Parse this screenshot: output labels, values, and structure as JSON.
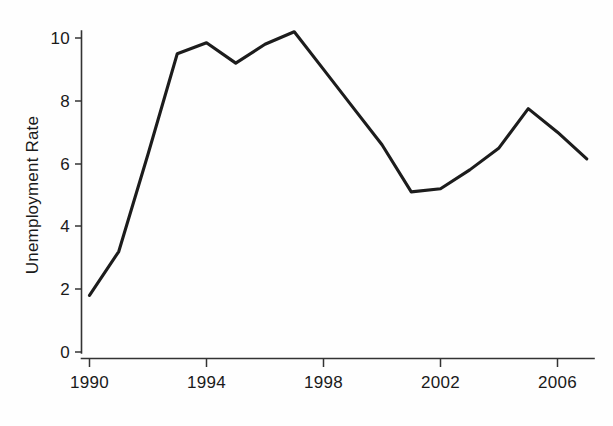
{
  "chart_data": {
    "type": "line",
    "title": "",
    "xlabel": "",
    "ylabel": "Unemployment Rate",
    "x": [
      1990,
      1991,
      1992,
      1993,
      1994,
      1995,
      1996,
      1997,
      1998,
      1999,
      2000,
      2001,
      2002,
      2003,
      2004,
      2005,
      2006,
      2007
    ],
    "values": [
      1.8,
      3.2,
      6.3,
      9.5,
      9.85,
      9.2,
      9.8,
      10.2,
      9.0,
      7.8,
      6.6,
      5.1,
      5.2,
      5.8,
      6.5,
      7.75,
      7.0,
      6.15
    ],
    "series": [
      {
        "name": "Unemployment Rate",
        "values": [
          1.8,
          3.2,
          6.3,
          9.5,
          9.85,
          9.2,
          9.8,
          10.2,
          9.0,
          7.8,
          6.6,
          5.1,
          5.2,
          5.8,
          6.5,
          7.75,
          7.0,
          6.15
        ],
        "color": "#1c1c1c"
      }
    ],
    "xlim": [
      1990,
      2007.6
    ],
    "ylim": [
      0,
      10.8
    ],
    "xticks": [
      1990,
      1994,
      1998,
      2002,
      2006
    ],
    "xtick_labels": [
      "1990",
      "1994",
      "1998",
      "2002",
      "2006"
    ],
    "yticks": [
      0,
      2,
      4,
      6,
      8,
      10
    ],
    "ytick_labels": [
      "0",
      "2",
      "4",
      "6",
      "8",
      "10"
    ],
    "grid": false,
    "legend": false,
    "legend_position": "none",
    "annotations": []
  },
  "axes": {
    "y_axis_title": "Unemployment Rate",
    "x_axis_title": ""
  },
  "colors": {
    "line": "#1c1c1c",
    "axis": "#333333",
    "background": "#fefefe",
    "text": "#1a1a1a"
  }
}
